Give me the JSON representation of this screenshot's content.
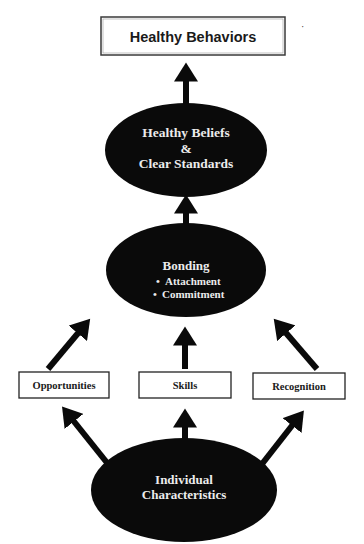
{
  "diagram": {
    "top_box": {
      "label": "Healthy Behaviors"
    },
    "beliefs": {
      "line1": "Healthy Beliefs",
      "line2": "&",
      "line3": "Clear Standards"
    },
    "bonding": {
      "title": "Bonding",
      "bullets": [
        {
          "text": "Attachment"
        },
        {
          "text": "Commitment"
        }
      ],
      "bullet_glyph": "•"
    },
    "boxes": [
      {
        "label": "Opportunities"
      },
      {
        "label": "Skills"
      },
      {
        "label": "Recognition"
      }
    ],
    "individual": {
      "line1": "Individual",
      "line2": "Characteristics"
    },
    "stray_mark": "·",
    "colors": {
      "node_fill": "#0a0a0a",
      "node_text": "#ececec",
      "box_border": "#333333",
      "arrow": "#0a0a0a"
    }
  }
}
